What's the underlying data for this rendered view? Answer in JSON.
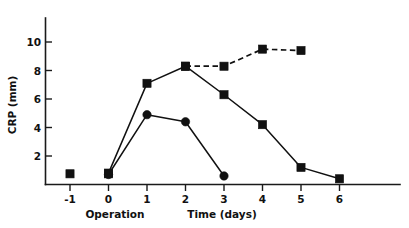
{
  "chart_data": {
    "type": "line",
    "title": "",
    "subtitle": "",
    "xlabel": "Time (days)",
    "ylabel": "CRP (mm)",
    "xlim": [
      -1.6,
      6.9
    ],
    "ylim": [
      0,
      11.2
    ],
    "xticks": [
      -1,
      0,
      1,
      2,
      3,
      4,
      5,
      6
    ],
    "xticklabels": [
      "-1",
      "0",
      "1",
      "2",
      "3",
      "4",
      "5",
      "6"
    ],
    "yticks": [
      2,
      4,
      6,
      8,
      10
    ],
    "yticklabels": [
      "2",
      "4",
      "6",
      "8",
      "10"
    ],
    "grid": false,
    "legend": "none",
    "annotations": [
      {
        "text": "Operation",
        "x": 0,
        "y": -1.55,
        "note": "label beneath x = 0 tick"
      }
    ],
    "series": [
      {
        "name": "squares-rising-then-falling",
        "marker": "square",
        "linestyle": "solid",
        "color": "#111111",
        "x": [
          0,
          1,
          2,
          3,
          4,
          5,
          6
        ],
        "values": [
          0.8,
          7.1,
          8.3,
          6.3,
          4.2,
          1.2,
          0.4
        ]
      },
      {
        "name": "squares-dashed-plateau",
        "marker": "square",
        "linestyle": "dashed",
        "color": "#111111",
        "x": [
          2,
          3,
          4,
          5
        ],
        "values": [
          8.3,
          8.3,
          9.5,
          9.4
        ]
      },
      {
        "name": "circles",
        "marker": "circle",
        "linestyle": "solid",
        "color": "#111111",
        "x": [
          0,
          1,
          2,
          3
        ],
        "values": [
          0.7,
          4.9,
          4.4,
          0.6
        ]
      },
      {
        "name": "baseline-markers",
        "marker": "square",
        "linestyle": "none",
        "color": "#111111",
        "x": [
          -1,
          0
        ],
        "values": [
          0.75,
          0.75
        ]
      }
    ]
  },
  "axes": {
    "y_title": "CRP (mm)",
    "x_title": "Time (days)",
    "operation_label": "Operation"
  },
  "ticks": {
    "y": [
      "10",
      "8",
      "6",
      "4",
      "2"
    ],
    "x": [
      "-1",
      "0",
      "1",
      "2",
      "3",
      "4",
      "5",
      "6"
    ]
  }
}
